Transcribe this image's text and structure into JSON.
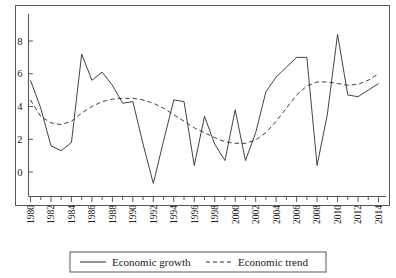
{
  "chart_data": {
    "type": "line",
    "title": "",
    "subtitle": "",
    "xlabel": "",
    "ylabel": "",
    "x": [
      1980,
      1981,
      1982,
      1983,
      1984,
      1985,
      1986,
      1987,
      1988,
      1989,
      1990,
      1991,
      1992,
      1993,
      1994,
      1995,
      1996,
      1997,
      1998,
      1999,
      2000,
      2001,
      2002,
      2003,
      2004,
      2005,
      2006,
      2007,
      2008,
      2009,
      2010,
      2011,
      2012,
      2013,
      2014
    ],
    "xlim": [
      1980,
      2014
    ],
    "ylim": [
      -1.2,
      9.4
    ],
    "yticks": [
      0,
      2,
      4,
      6,
      8
    ],
    "ytick_labels": [
      "0",
      "2",
      "4",
      "6",
      "8"
    ],
    "xticks": [
      1980,
      1982,
      1984,
      1986,
      1988,
      1990,
      1992,
      1994,
      1996,
      1998,
      2000,
      2002,
      2004,
      2006,
      2008,
      2010,
      2012,
      2014
    ],
    "xtick_labels": [
      "1980",
      "1982",
      "1984",
      "1986",
      "1988",
      "1990",
      "1992",
      "1994",
      "1996",
      "1998",
      "2000",
      "2002",
      "2004",
      "2006",
      "2008",
      "2010",
      "2012",
      "2014"
    ],
    "xtick_minor_every": 1,
    "xtick_label_rotation": 90,
    "grid": false,
    "legend_position": "bottom-center",
    "series": [
      {
        "name": "Economic growth",
        "style": "solid",
        "color": "#2c2c2c",
        "values": [
          5.6,
          3.9,
          1.6,
          1.3,
          1.8,
          7.2,
          5.6,
          6.1,
          5.3,
          4.2,
          4.3,
          1.7,
          -0.7,
          1.9,
          4.4,
          4.3,
          0.4,
          3.4,
          1.7,
          0.7,
          3.8,
          0.7,
          2.4,
          4.9,
          5.8,
          6.4,
          7.0,
          7.0,
          0.4,
          3.5,
          8.4,
          4.7,
          4.6,
          5.0,
          5.4
        ]
      },
      {
        "name": "Economic trend",
        "style": "dashed",
        "color": "#2c2c2c",
        "values": [
          4.4,
          3.4,
          3.0,
          2.9,
          3.1,
          3.6,
          4.0,
          4.3,
          4.45,
          4.5,
          4.5,
          4.4,
          4.2,
          3.9,
          3.5,
          3.1,
          2.7,
          2.4,
          2.1,
          1.85,
          1.75,
          1.75,
          1.95,
          2.4,
          3.1,
          3.9,
          4.7,
          5.25,
          5.5,
          5.5,
          5.4,
          5.3,
          5.35,
          5.6,
          6.0
        ]
      }
    ]
  },
  "legend": {
    "items": [
      {
        "label": "Economic growth",
        "style": "solid"
      },
      {
        "label": "Economic trend",
        "style": "dashed"
      }
    ]
  }
}
